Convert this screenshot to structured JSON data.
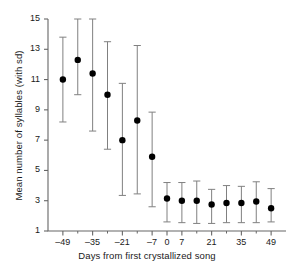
{
  "chart_data": {
    "type": "scatter",
    "title": "",
    "xlabel": "Days from first crystallized song",
    "ylabel": "Mean number of syllables (with sd)",
    "xlim": [
      -56,
      56
    ],
    "ylim": [
      1,
      15
    ],
    "grid": false,
    "legend": null,
    "yticks": [
      1,
      3,
      5,
      7,
      9,
      11,
      13,
      15
    ],
    "ytick_labels": [
      "1",
      "3",
      "5",
      "7",
      "9",
      "11",
      "13",
      "15"
    ],
    "xticks": [
      -49,
      -35,
      -21,
      -7,
      0,
      7,
      21,
      35,
      49
    ],
    "xtick_labels": [
      "–49",
      "–35",
      "–21",
      "–7",
      "0",
      "7",
      "21",
      "35",
      "49"
    ],
    "xminor_ticks": [
      -42,
      -28,
      -14,
      14,
      28,
      42
    ],
    "marker": "filled-circle",
    "errorbar": "sd",
    "x": [
      -49,
      -42,
      -35,
      -28,
      -21,
      -14,
      -7,
      0,
      7,
      14,
      21,
      28,
      35,
      42,
      49
    ],
    "values": [
      11.0,
      12.3,
      11.4,
      10.0,
      7.0,
      8.3,
      5.9,
      3.15,
      3.0,
      3.0,
      2.75,
      2.85,
      2.85,
      2.95,
      2.5
    ],
    "err_low": [
      8.2,
      10.0,
      7.6,
      6.4,
      3.35,
      3.45,
      2.6,
      1.6,
      1.55,
      1.5,
      1.5,
      1.55,
      1.55,
      1.55,
      1.6
    ],
    "err_high": [
      13.8,
      15.1,
      15.2,
      13.5,
      10.75,
      13.25,
      8.85,
      4.2,
      4.2,
      4.3,
      3.75,
      4.0,
      3.95,
      4.25,
      3.8
    ],
    "points": [
      {
        "day": "–49",
        "mean": 11.0,
        "sd_low": 8.2,
        "sd_high": 13.8
      },
      {
        "day": "–42",
        "mean": 12.3,
        "sd_low": 10.0,
        "sd_high": 15.1
      },
      {
        "day": "–35",
        "mean": 11.4,
        "sd_low": 7.6,
        "sd_high": 15.2
      },
      {
        "day": "–28",
        "mean": 10.0,
        "sd_low": 6.4,
        "sd_high": 13.5
      },
      {
        "day": "–21",
        "mean": 7.0,
        "sd_low": 3.35,
        "sd_high": 10.75
      },
      {
        "day": "–14",
        "mean": 8.3,
        "sd_low": 3.45,
        "sd_high": 13.25
      },
      {
        "day": "–7",
        "mean": 5.9,
        "sd_low": 2.6,
        "sd_high": 8.85
      },
      {
        "day": "0",
        "mean": 3.15,
        "sd_low": 1.6,
        "sd_high": 4.2
      },
      {
        "day": "7",
        "mean": 3.0,
        "sd_low": 1.55,
        "sd_high": 4.2
      },
      {
        "day": "14",
        "mean": 3.0,
        "sd_low": 1.5,
        "sd_high": 4.3
      },
      {
        "day": "21",
        "mean": 2.75,
        "sd_low": 1.5,
        "sd_high": 3.75
      },
      {
        "day": "28",
        "mean": 2.85,
        "sd_low": 1.55,
        "sd_high": 4.0
      },
      {
        "day": "35",
        "mean": 2.85,
        "sd_low": 1.55,
        "sd_high": 3.95
      },
      {
        "day": "42",
        "mean": 2.95,
        "sd_low": 1.55,
        "sd_high": 4.25
      },
      {
        "day": "49",
        "mean": 2.5,
        "sd_low": 1.6,
        "sd_high": 3.8
      }
    ],
    "colors": {
      "marker": "#000000",
      "errorbar": "#808080",
      "axis": "#666666",
      "text": "#1a1a1a",
      "background": "#ffffff"
    }
  }
}
